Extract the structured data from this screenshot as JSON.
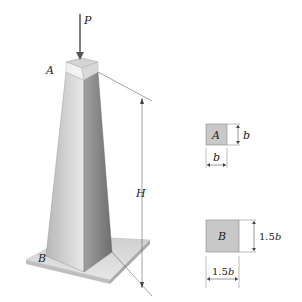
{
  "figure": {
    "load_label": "P",
    "top_point_label": "A",
    "bottom_point_label": "B",
    "height_label": "H",
    "section_a": {
      "label": "A",
      "width_label": "b",
      "height_label": "b"
    },
    "section_b": {
      "label": "B",
      "width_label_num": "1.5",
      "width_label_var": "b",
      "height_label_num": "1.5",
      "height_label_var": "b"
    }
  },
  "colors": {
    "pillar_light": "#e4e4e4",
    "pillar_dark": "#8c8c8c",
    "section_fill": "#c8c8c8",
    "base_plate": "#d0d0d0",
    "line": "#444444"
  }
}
